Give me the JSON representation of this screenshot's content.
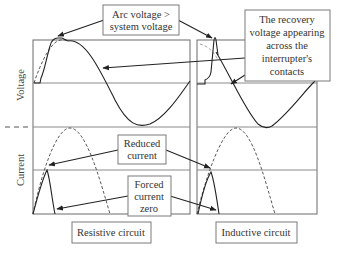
{
  "axes": {
    "voltage_label": "Voltage",
    "current_label": "Current"
  },
  "annotations": {
    "arc_voltage": [
      "Arc voltage >",
      "system voltage"
    ],
    "recovery_voltage": [
      "The recovery",
      "voltage appearing",
      "across the",
      "interrupter's",
      "contacts"
    ],
    "reduced_current": [
      "Reduced",
      "current"
    ],
    "forced_zero": [
      "Forced",
      "current",
      "zero"
    ]
  },
  "panels": {
    "resistive": {
      "caption": "Resistive circuit"
    },
    "inductive": {
      "caption": "Inductive circuit"
    }
  },
  "colors": {
    "line": "#222222",
    "frame": "#6a6a6a",
    "box_border": "#7a7a7a",
    "text": "#333333"
  }
}
